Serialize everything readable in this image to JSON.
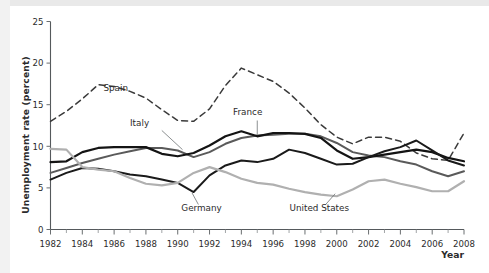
{
  "figure": {
    "background": "#ffffff",
    "axis_color": "#55595c"
  },
  "chart_data": {
    "type": "line",
    "title": "",
    "xlabel": "Year",
    "ylabel": "Unemployment rate (percent)",
    "xlim": [
      1982,
      2008
    ],
    "ylim": [
      0,
      25
    ],
    "yticks": [
      0,
      5,
      10,
      15,
      20,
      25
    ],
    "ytick_labels": [
      "0",
      "5",
      "10",
      "15",
      "20",
      "25"
    ],
    "xticks": [
      1982,
      1984,
      1986,
      1988,
      1990,
      1992,
      1994,
      1996,
      1998,
      2000,
      2002,
      2004,
      2006,
      2008
    ],
    "xtick_labels": [
      "1982",
      "1984",
      "1986",
      "1988",
      "1990",
      "1992",
      "1994",
      "1996",
      "1998",
      "2000",
      "2002",
      "2004",
      "2006",
      "2008"
    ],
    "minor_xtick_step": 1,
    "grid": false,
    "legend": "inline-labels",
    "x": [
      1982,
      1983,
      1984,
      1985,
      1986,
      1987,
      1988,
      1989,
      1990,
      1991,
      1992,
      1993,
      1994,
      1995,
      1996,
      1997,
      1998,
      1999,
      2000,
      2001,
      2002,
      2003,
      2004,
      2005,
      2006,
      2007,
      2008
    ],
    "series": [
      {
        "name": "Spain",
        "label": "Spain",
        "color": "#3a3a3a",
        "style": "dashed",
        "width": 1.5,
        "values": [
          13.0,
          14.2,
          15.7,
          17.4,
          17.2,
          16.6,
          15.8,
          14.4,
          13.1,
          13.0,
          14.5,
          17.3,
          19.4,
          18.6,
          17.8,
          16.4,
          14.6,
          12.6,
          11.1,
          10.3,
          11.1,
          11.1,
          10.6,
          9.2,
          8.5,
          8.3,
          11.6
        ]
      },
      {
        "name": "Italy",
        "label": "Italy",
        "color": "#5a5a5a",
        "style": "solid",
        "width": 2.0,
        "values": [
          6.8,
          7.4,
          8.0,
          8.5,
          9.0,
          9.4,
          9.8,
          9.8,
          9.5,
          8.7,
          9.3,
          10.3,
          11.0,
          11.3,
          11.4,
          11.5,
          11.5,
          11.2,
          10.4,
          9.3,
          8.9,
          8.7,
          8.2,
          7.8,
          7.0,
          6.4,
          7.0
        ]
      },
      {
        "name": "France",
        "label": "France",
        "color": "#141414",
        "style": "solid",
        "width": 2.2,
        "values": [
          8.1,
          8.2,
          9.3,
          9.8,
          9.9,
          9.9,
          9.9,
          9.1,
          8.8,
          9.2,
          10.1,
          11.2,
          11.8,
          11.2,
          11.6,
          11.6,
          11.5,
          11.0,
          9.5,
          8.5,
          8.7,
          9.0,
          9.3,
          9.6,
          9.3,
          8.6,
          8.2
        ]
      },
      {
        "name": "Germany",
        "label": "Germany",
        "color": "#1a1a1a",
        "style": "solid",
        "width": 2.0,
        "values": [
          6.0,
          6.8,
          7.4,
          7.3,
          7.0,
          6.6,
          6.4,
          6.0,
          5.6,
          4.5,
          6.5,
          7.7,
          8.3,
          8.1,
          8.5,
          9.6,
          9.2,
          8.5,
          7.8,
          7.9,
          8.7,
          9.4,
          9.9,
          10.7,
          9.5,
          8.3,
          7.7
        ]
      },
      {
        "name": "United States",
        "label": "United States",
        "color": "#b0b0b0",
        "style": "solid",
        "width": 2.2,
        "values": [
          9.7,
          9.6,
          7.5,
          7.2,
          7.0,
          6.2,
          5.5,
          5.3,
          5.6,
          6.8,
          7.5,
          6.9,
          6.1,
          5.6,
          5.4,
          4.9,
          4.5,
          4.2,
          4.0,
          4.8,
          5.8,
          6.0,
          5.5,
          5.1,
          4.6,
          4.6,
          5.8
        ]
      }
    ],
    "annotations": [
      {
        "name": "spain-label",
        "text": "Spain",
        "x": 1986.1,
        "y": 16.6,
        "leader": null
      },
      {
        "name": "italy-label",
        "text": "Italy",
        "x": 1987.6,
        "y": 12.4,
        "leader": {
          "x1": 1989.0,
          "y1": 11.9,
          "x2": 1990.3,
          "y2": 9.6
        }
      },
      {
        "name": "france-label",
        "text": "France",
        "x": 1994.4,
        "y": 13.8,
        "leader": {
          "x1": 1995.0,
          "y1": 13.1,
          "x2": 1995.0,
          "y2": 11.4
        }
      },
      {
        "name": "germany-label",
        "text": "Germany",
        "x": 1991.5,
        "y": 2.2,
        "leader": {
          "x1": 1991.3,
          "y1": 3.0,
          "x2": 1990.9,
          "y2": 4.4
        }
      },
      {
        "name": "us-label",
        "text": "United States",
        "x": 1998.9,
        "y": 2.2,
        "leader": {
          "x1": 1999.3,
          "y1": 3.0,
          "x2": 1999.9,
          "y2": 4.3
        }
      }
    ]
  }
}
